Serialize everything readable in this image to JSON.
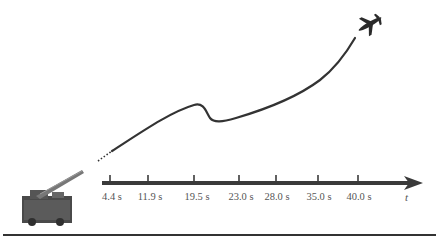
{
  "figure": {
    "axis": {
      "variable": "t",
      "ticks": [
        {
          "label": "4.4 s",
          "x": 110
        },
        {
          "label": "11.9 s",
          "x": 148
        },
        {
          "label": "19.5 s",
          "x": 194
        },
        {
          "label": "23.0 s",
          "x": 239
        },
        {
          "label": "28.0 s",
          "x": 276
        },
        {
          "label": "35.0 s",
          "x": 318
        },
        {
          "label": "40.0 s",
          "x": 358
        }
      ]
    },
    "icons": {
      "launcher": "missile-launcher-vehicle-icon",
      "target": "airplane-icon"
    },
    "colors": {
      "ink": "#333333",
      "axis": "#3a3a3a",
      "label": "#555555"
    }
  }
}
